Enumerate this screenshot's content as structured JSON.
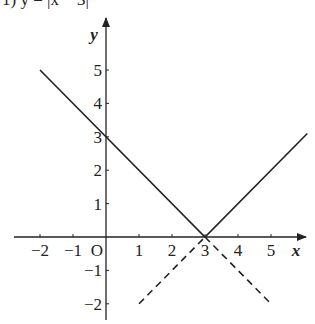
{
  "title": "1) y = |x − 3|",
  "chart_data": {
    "type": "line",
    "title": "1) y = |x − 3|",
    "xlabel": "x",
    "ylabel": "y",
    "origin_label": "O",
    "xlim": [
      -2.3,
      6.2
    ],
    "ylim": [
      -2.5,
      6.0
    ],
    "grid": false,
    "x_ticks": [
      -2,
      -1,
      1,
      2,
      3,
      4,
      5
    ],
    "x_tick_labels": [
      "−2",
      "−1",
      "1",
      "2",
      "3",
      "4",
      "5"
    ],
    "y_ticks": [
      -2,
      -1,
      1,
      2,
      3,
      4,
      5
    ],
    "y_tick_labels": [
      "−2",
      "−1",
      "1",
      "2",
      "3",
      "4",
      "5"
    ],
    "series": [
      {
        "name": "y = |x − 3|",
        "style": "solid",
        "points": [
          [
            -2,
            5
          ],
          [
            3,
            0
          ],
          [
            6.1,
            3.1
          ]
        ]
      },
      {
        "name": "y = x − 3 (below axis)",
        "style": "dashed",
        "points": [
          [
            1,
            -2
          ],
          [
            3,
            0
          ]
        ]
      },
      {
        "name": "y = −x + 3 (below axis)",
        "style": "dashed",
        "points": [
          [
            3,
            0
          ],
          [
            5,
            -2
          ]
        ]
      }
    ]
  }
}
